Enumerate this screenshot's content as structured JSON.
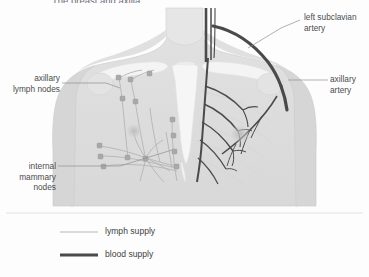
{
  "figure": {
    "title": "The breast and axilla.",
    "width": 369,
    "height": 277,
    "background_color": "#fdfdfd"
  },
  "colors": {
    "skin_fill": "#dcdcdc",
    "skin_fill_light": "#e4e4e4",
    "bone_fill": "#f2f2f2",
    "artery_dark": "#4a4a4a",
    "lymph_line": "#b8b8b8",
    "lymph_node": "#a8a8a8",
    "leader_line": "#8c8c8c",
    "label_text": "#4c4c4c",
    "divider": "#d8d8d8"
  },
  "labels": [
    {
      "id": "left-subclavian-artery",
      "text": "left subclavian\nartery",
      "align": "left",
      "x": 304,
      "y": 12
    },
    {
      "id": "axillary-artery",
      "text": "axillary\nartery",
      "align": "left",
      "x": 330,
      "y": 74
    },
    {
      "id": "axillary-lymph-nodes",
      "text": "axillary\nlymph nodes",
      "align": "right",
      "x": 8,
      "y": 73
    },
    {
      "id": "internal-mammary-nodes",
      "text": "internal\nmammary\nnodes",
      "align": "right",
      "x": 6,
      "y": 161
    }
  ],
  "legend": {
    "items": [
      {
        "id": "lymph-supply",
        "label": "lymph supply",
        "swatch": "thin-light-line",
        "color": "#b8b8b8"
      },
      {
        "id": "blood-supply",
        "label": "blood supply",
        "swatch": "thick-dark-line",
        "color": "#4a4a4a"
      }
    ]
  },
  "diagram_content": {
    "view": "anterior chest, female torso, head and arms cropped",
    "structures": [
      "neck",
      "clavicles",
      "sternum",
      "ribs",
      "left breast with lymphatic network",
      "right breast with arterial network",
      "shoulders / upper arms"
    ],
    "lymph_nodes_drawn": 14,
    "laterality_note": "lymph supply shown on viewer's left breast; blood supply shown on viewer's right breast"
  }
}
